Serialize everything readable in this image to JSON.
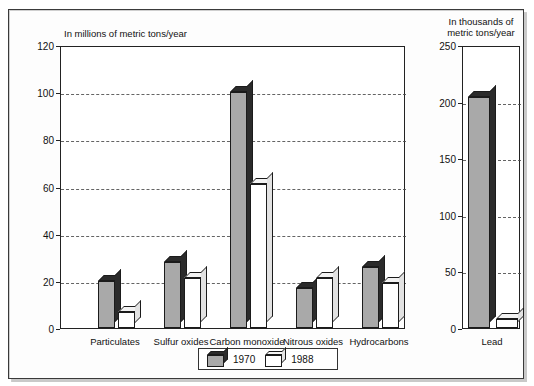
{
  "chart_data": {
    "type": "bar",
    "title": "",
    "subtitle": "",
    "panels": [
      {
        "id": "left-panel",
        "ylabel": "In millions of metric tons/year",
        "xlabel": "",
        "ylim": [
          0,
          120
        ],
        "yticks": [
          0,
          20,
          40,
          60,
          80,
          100,
          120
        ],
        "ytick_labels": [
          "0",
          "20",
          "40",
          "60",
          "80",
          "100",
          "120"
        ],
        "grid": true,
        "categories": [
          "Particulates",
          "Sulfur oxides",
          "Carbon monoxide",
          "Nitrous oxides",
          "Hydrocarbons"
        ],
        "series": [
          {
            "name": "1970",
            "values": [
              20,
              28,
              100,
              17,
              26
            ]
          },
          {
            "name": "1988",
            "values": [
              7,
              21,
              61,
              21,
              19
            ]
          }
        ]
      },
      {
        "id": "right-panel",
        "ylabel": "In thousands of\nmetric tons/year",
        "xlabel": "",
        "ylim": [
          0,
          250
        ],
        "yticks": [
          0,
          50,
          100,
          150,
          200,
          250
        ],
        "ytick_labels": [
          "0",
          "50",
          "100",
          "150",
          "200",
          "250"
        ],
        "grid": true,
        "categories": [
          "Lead"
        ],
        "series": [
          {
            "name": "1970",
            "values": [
              204
            ]
          },
          {
            "name": "1988",
            "values": [
              8
            ]
          }
        ]
      }
    ],
    "legend": {
      "position": "bottom-center",
      "entries": [
        {
          "label": "1970",
          "color": "#a9a9a9"
        },
        {
          "label": "1988",
          "color": "#ffffff"
        }
      ]
    },
    "colors": {
      "series_1970_fill": "#a9a9a9",
      "series_1970_shade": "#2b2b2b",
      "series_1988_fill": "#ffffff",
      "series_1988_shade": "#e2e2e2",
      "outline": "#1b1b1b",
      "gridline": "#4a4a4a",
      "frame": "#3a3a3a"
    }
  }
}
